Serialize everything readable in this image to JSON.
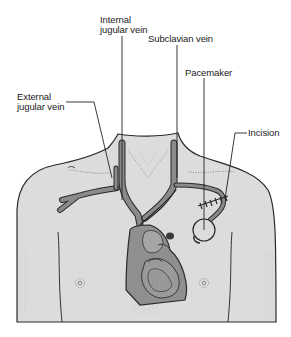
{
  "figure": {
    "type": "anatomical-illustration",
    "colors": {
      "skin": "#dcdcdc",
      "vein": "#8a8a8a",
      "heart": "#8f8f8f",
      "outline": "#2a2a2a",
      "background": "#ffffff"
    }
  },
  "labels": {
    "internal_jugular_vein": "Internal\njugular vein",
    "subclavian_vein": "Subclavian vein",
    "pacemaker": "Pacemaker",
    "external_jugular_vein": "External\njugular vein",
    "incision": "Incision"
  }
}
